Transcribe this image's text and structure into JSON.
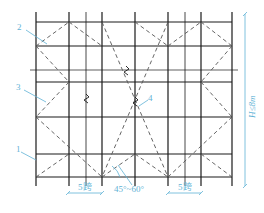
{
  "diagram": {
    "type": "scaffold-bracing-elevation",
    "colors": {
      "structure": "#1a1a1a",
      "brace": "#555555",
      "annotation": "#5fb3d6"
    },
    "grid": {
      "verticals_x": [
        36,
        69,
        86,
        102,
        135,
        168,
        185,
        201,
        232
      ],
      "horizontals_y": [
        22,
        46,
        82,
        117,
        154,
        177
      ],
      "thin_horizontal_y": 70,
      "top": 12,
      "bottom": 186,
      "left": 36,
      "right": 232
    },
    "braces": [
      [
        36,
        46,
        69,
        22
      ],
      [
        69,
        22,
        102,
        46
      ],
      [
        36,
        46,
        69,
        82
      ],
      [
        69,
        82,
        36,
        117
      ],
      [
        36,
        117,
        102,
        177
      ],
      [
        36,
        177,
        69,
        154
      ],
      [
        102,
        22,
        168,
        177
      ],
      [
        168,
        22,
        102,
        177
      ],
      [
        102,
        177,
        135,
        154
      ],
      [
        135,
        154,
        168,
        177
      ],
      [
        135,
        22,
        168,
        46
      ],
      [
        168,
        46,
        201,
        22
      ],
      [
        201,
        22,
        232,
        46
      ],
      [
        232,
        46,
        201,
        82
      ],
      [
        201,
        82,
        232,
        117
      ],
      [
        168,
        177,
        232,
        117
      ],
      [
        201,
        154,
        232,
        177
      ]
    ],
    "labels": {
      "item1": "1",
      "item2": "2",
      "item3": "3",
      "item4": "4",
      "span_left": "5跨",
      "span_right": "5跨",
      "angle": "45°~60°",
      "height": "H≤8m"
    }
  }
}
